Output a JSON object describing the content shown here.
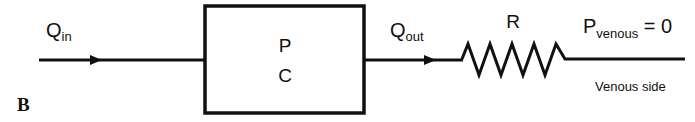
{
  "panel_label": "B",
  "inflow": {
    "main": "Q",
    "sub": "in"
  },
  "compartment": {
    "line1": "P",
    "line2": "C"
  },
  "outflow": {
    "main": "Q",
    "sub": "out"
  },
  "resistor": {
    "label": "R"
  },
  "venous_pressure": {
    "main": "P",
    "sub": "venous",
    "value": " = 0"
  },
  "venous_side_label": "Venous side",
  "colors": {
    "stroke": "#111111",
    "background": "#ffffff"
  }
}
